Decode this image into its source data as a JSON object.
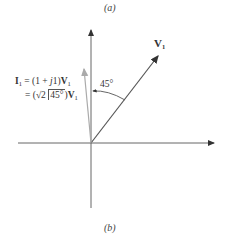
{
  "captions": {
    "top": "(a)",
    "bottom": "(b)"
  },
  "phasors": {
    "v1": {
      "symbol": "V",
      "subscript": "1",
      "angle_deg": 45,
      "color": "#555555"
    },
    "i1": {
      "line1": {
        "lhs": "I",
        "lhs_sub": "1",
        "eq": " = (1 + ",
        "j": "j",
        "rest": "1)",
        "v": "V",
        "v_sub": "1"
      },
      "line2": {
        "eq": "= (",
        "sqrt": "√2 ",
        "angle": "45°",
        "close": ")",
        "v": "V",
        "v_sub": "1"
      },
      "color": "#aaaaaa"
    }
  },
  "angle_label": "45°",
  "colors": {
    "axis": "#555555",
    "i1_vector": "#aaaaaa",
    "v1_vector": "#555555"
  }
}
